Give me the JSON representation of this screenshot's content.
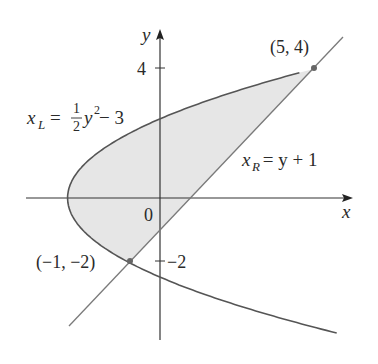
{
  "diagram": {
    "type": "region-between-curves",
    "axes": {
      "x_label": "x",
      "y_label": "y",
      "origin_label": "0",
      "y_ticks": [
        {
          "value": 4,
          "label": "4"
        },
        {
          "value": -2,
          "label": "−2"
        }
      ]
    },
    "curves": [
      {
        "name": "left-curve",
        "equation": "x_L = 1/2 y^2 - 3",
        "label_var": "x",
        "label_sub": "L",
        "label_eq": " = ",
        "label_frac_num": "1",
        "label_frac_den": "2",
        "label_rest_base": "y",
        "label_rest_sup": "2",
        "label_rest_tail": " − 3"
      },
      {
        "name": "right-line",
        "equation": "x_R = y + 1",
        "label_var": "x",
        "label_sub": "R",
        "label_rest": " = y + 1"
      }
    ],
    "points": [
      {
        "name": "upper-intersection",
        "x": 5,
        "y": 4,
        "label": "(5, 4)"
      },
      {
        "name": "lower-intersection",
        "x": -1,
        "y": -2,
        "label": "(−1, −2)"
      }
    ],
    "shaded_region": {
      "y_from": -2,
      "y_to": 4,
      "between": [
        "x_L",
        "x_R"
      ]
    },
    "colors": {
      "curve": "#555555",
      "line": "#7a7a7a",
      "axis": "#333333",
      "fill": "#e6e6e6",
      "point": "#666666",
      "text": "#2a2a2a"
    }
  }
}
